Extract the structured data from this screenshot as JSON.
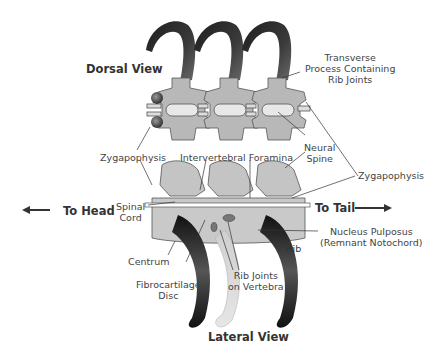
{
  "colors": {
    "bone": "#b8b8b8",
    "bone_outline": "#555555",
    "centrum_light": "#c9c9c9",
    "rib_dark": "#2a2a2a",
    "rib_light": "#dcdcdc",
    "foramen": "#e8e8e8",
    "text": "#444444",
    "title_text": "#333333"
  },
  "titles": {
    "dorsal": "Dorsal View",
    "lateral": "Lateral View"
  },
  "direction": {
    "head": "To Head",
    "tail": "To Tail"
  },
  "labels": {
    "transverse": [
      "Transverse",
      "Process Containing",
      "Rib Joints"
    ],
    "zygapophysis_left": "Zygapophysis",
    "intervertebral": "Intervertebral Foramina",
    "neural_spine": [
      "Neural",
      "Spine"
    ],
    "zygapophysis_right": "Zygapophysis",
    "spinal_cord": [
      "Spinal",
      "Cord"
    ],
    "nucleus": [
      "Nucleus Pulposus",
      "(Remnant Notochord)"
    ],
    "rib": "Rib",
    "centrum": "Centrum",
    "fibrocartilage": [
      "Fibrocartilage",
      "Disc"
    ],
    "rib_joints": [
      "Rib Joints",
      "on Vertebra"
    ]
  }
}
